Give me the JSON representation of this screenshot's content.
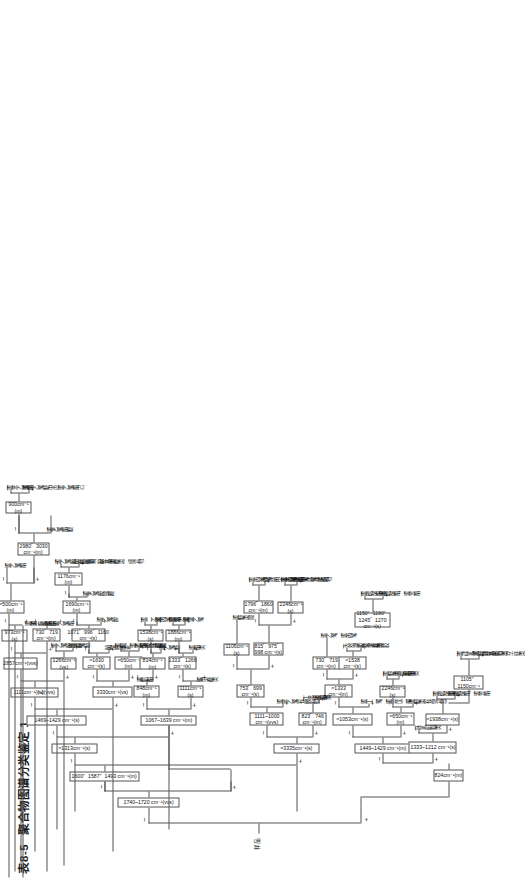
{
  "title": {
    "number": "表8-5",
    "text": "聚合物图谱分类鉴定 1"
  },
  "diagram": {
    "type": "decision-tree",
    "orientation": "rotated-90ccw",
    "root_label": "样品",
    "plus": "+",
    "minus": "—",
    "nodes": [
      {
        "id": "n0",
        "text": "1740~1720 cm⁻¹(vvs)"
      },
      {
        "id": "n1",
        "text": "1600、1587、1493 cm⁻¹(m)"
      },
      {
        "id": "n2",
        "text": "1600、1587、1494cm⁻¹(m)"
      },
      {
        "id": "n3",
        "text": "≈1313cm⁻¹(s)"
      },
      {
        "id": "n4",
        "text": "1469~1429 cm⁻¹(s)"
      },
      {
        "id": "n5",
        "text": "1111cm⁻¹(宽)(vvs)"
      },
      {
        "id": "n6",
        "text": "2857cm⁻¹(vvs)"
      },
      {
        "id": "n7",
        "text": "≈500cm⁻¹\n(m)"
      },
      {
        "id": "n8",
        "text": "973cm⁻¹\n(s)"
      },
      {
        "id": "n9",
        "text": "730、719\ncm⁻¹(m)"
      },
      {
        "id": "n10",
        "text": "2980、3030\ncm⁻¹(m)"
      },
      {
        "id": "n11",
        "text": "900cm⁻¹\n(m)"
      },
      {
        "id": "n12",
        "text": "1266cm⁻¹\n(vs)"
      },
      {
        "id": "n13",
        "text": "3330cm⁻¹(vs)"
      },
      {
        "id": "n14",
        "text": "≈1630\ncm⁻¹(s)"
      },
      {
        "id": "n15",
        "text": "1071、996、1160\ncm⁻¹(s)"
      },
      {
        "id": "n16",
        "text": "1690cm⁻¹\n(m)"
      },
      {
        "id": "n17",
        "text": "1176cm⁻¹\n(m)"
      },
      {
        "id": "n18",
        "text": "≈650cm⁻¹\n(m)"
      },
      {
        "id": "n19",
        "text": "1067~1639 cm⁻¹(m)"
      },
      {
        "id": "n20",
        "text": "848cm⁻¹\n(m)"
      },
      {
        "id": "n21",
        "text": "814cm⁻¹\n(m)"
      },
      {
        "id": "n22",
        "text": "1538cm⁻¹\n(s)"
      },
      {
        "id": "n23",
        "text": "1111cm⁻¹\n(s)"
      },
      {
        "id": "n24",
        "text": "1333、1266\ncm⁻¹(s)"
      },
      {
        "id": "n25",
        "text": "1886cm⁻¹\n(m)"
      },
      {
        "id": "n26",
        "text": "≈3335cm⁻¹(s)"
      },
      {
        "id": "n27",
        "text": "1111~1000\ncm⁻¹(vvs)"
      },
      {
        "id": "n28",
        "text": "753、699\ncm⁻¹(s)"
      },
      {
        "id": "n29",
        "text": "823、746\ncm⁻¹(m)"
      },
      {
        "id": "n30",
        "text": "1106cm⁻¹\n(s)"
      },
      {
        "id": "n31",
        "text": "815、975、\n998 cm⁻¹(s)"
      },
      {
        "id": "n32",
        "text": "1796、1860\ncm⁻¹(m)"
      },
      {
        "id": "n33",
        "text": "2246cm⁻¹\n(s)"
      },
      {
        "id": "n34",
        "text": "1449~1429 cm⁻¹(m)"
      },
      {
        "id": "n35",
        "text": "≈1053cm⁻¹(s)"
      },
      {
        "id": "n36",
        "text": "≈1333\ncm⁻¹(m)"
      },
      {
        "id": "n37",
        "text": "≈1538\ncm⁻¹(s)"
      },
      {
        "id": "n38",
        "text": "730、719\ncm⁻¹(m)"
      },
      {
        "id": "n39",
        "text": "≈650cm⁻¹\n(m)"
      },
      {
        "id": "n40",
        "text": "2246cm⁻¹\n(s)"
      },
      {
        "id": "n41",
        "text": "1150、1190、\n1245、1270\ncm⁻¹(s)"
      },
      {
        "id": "n42",
        "text": "1030cm⁻¹\n(m)"
      },
      {
        "id": "n43",
        "text": "824cm⁻¹(m)"
      },
      {
        "id": "n44",
        "text": "1333~1212 cm⁻¹(s)"
      },
      {
        "id": "n45",
        "text": "≈1938cm⁻¹(s)"
      },
      {
        "id": "n46",
        "text": "1105、\n1150cm⁻¹"
      }
    ],
    "leaves": [
      {
        "id": "l1",
        "text": "聚乙烯酯"
      },
      {
        "id": "l2",
        "text": "聚乙烯醇缩醛"
      },
      {
        "id": "l3",
        "text": "聚乙烯酯"
      },
      {
        "id": "l4",
        "text": "聚第三乙烯酯"
      },
      {
        "id": "l5",
        "text": "聚乙烯醚"
      },
      {
        "id": "l6",
        "text": "聚一烯酯"
      },
      {
        "id": "l7",
        "text": "聚苯乙烯酯"
      },
      {
        "id": "l8",
        "text": "聚苯乙烯醚中的聚乙烯酯己"
      },
      {
        "id": "l9",
        "text": "聚乙烯酯醚"
      },
      {
        "id": "l10",
        "text": "聚醛、聚乙烯醇缩醛类"
      },
      {
        "id": "l11",
        "text": "聚酯类共缩醛"
      },
      {
        "id": "l12",
        "text": "醋酸纤维素"
      },
      {
        "id": "l13",
        "text": "聚乙烯醇"
      },
      {
        "id": "l14",
        "text": "聚乙烯醇、纤维素、羟基类"
      },
      {
        "id": "l15",
        "text": "聚酰胺（尼龙类）"
      },
      {
        "id": "l16",
        "text": "酚醛树脂（酚－甲醛类）缩合物"
      },
      {
        "id": "l17",
        "text": "聚乙烯醇缩醛"
      },
      {
        "id": "l18",
        "text": "聚氨酯"
      },
      {
        "id": "l19",
        "text": "聚乙烯醚"
      },
      {
        "id": "l20",
        "text": "聚二乙烯"
      },
      {
        "id": "l21",
        "text": "聚丙烯酸酯"
      },
      {
        "id": "l22",
        "text": "聚氯乙烯"
      },
      {
        "id": "l23",
        "text": "聚酯类"
      },
      {
        "id": "l24",
        "text": "聚甲醛类"
      },
      {
        "id": "l25",
        "text": "聚苯乙烯(有缔合物)"
      },
      {
        "id": "l26",
        "text": "丁苯聚合物"
      },
      {
        "id": "l27",
        "text": "聚醚类胺"
      },
      {
        "id": "l28",
        "text": "聚丙烯腈、丙－苯共聚物"
      },
      {
        "id": "l29",
        "text": "丙烯腈－苯乙烯－丁二烯共聚物"
      },
      {
        "id": "l30",
        "text": "聚丙烯腈类"
      },
      {
        "id": "l31",
        "text": "聚碳酸酯类"
      },
      {
        "id": "l32",
        "text": "聚碳酸酯、聚芳酯"
      },
      {
        "id": "l33",
        "text": "环氧树脂类"
      },
      {
        "id": "l34",
        "text": "聚丙烯腈共聚物"
      },
      {
        "id": "l35",
        "text": "聚丁二烯、聚异戊二烯"
      },
      {
        "id": "l36",
        "text": "聚氯乙烯"
      },
      {
        "id": "l37",
        "text": "天然橡胶、丁基橡胶"
      },
      {
        "id": "l38",
        "text": "聚乙烯、聚丙烯"
      },
      {
        "id": "l39",
        "text": "丁基橡胶类"
      },
      {
        "id": "l40",
        "text": "聚醚类(有缔合物)"
      },
      {
        "id": "l41",
        "text": "聚醚类、聚酯类"
      },
      {
        "id": "l42",
        "text": "聚氨酯类"
      },
      {
        "id": "l43",
        "text": "聚硅氧烷＞环氧树脂类"
      },
      {
        "id": "l44",
        "text": "聚醚(羟基类＞分子链类)"
      }
    ]
  }
}
